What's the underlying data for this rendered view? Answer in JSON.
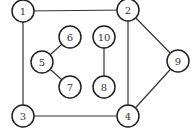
{
  "graph": {
    "nodes": [
      {
        "id": "1",
        "label": "1"
      },
      {
        "id": "2",
        "label": "2"
      },
      {
        "id": "3",
        "label": "3"
      },
      {
        "id": "4",
        "label": "4"
      },
      {
        "id": "5",
        "label": "5"
      },
      {
        "id": "6",
        "label": "6"
      },
      {
        "id": "7",
        "label": "7"
      },
      {
        "id": "8",
        "label": "8"
      },
      {
        "id": "9",
        "label": "9"
      },
      {
        "id": "10",
        "label": "10"
      }
    ],
    "edges": [
      [
        "1",
        "2"
      ],
      [
        "1",
        "3"
      ],
      [
        "3",
        "4"
      ],
      [
        "2",
        "4"
      ],
      [
        "2",
        "9"
      ],
      [
        "9",
        "4"
      ],
      [
        "5",
        "6"
      ],
      [
        "5",
        "7"
      ],
      [
        "10",
        "8"
      ]
    ]
  }
}
